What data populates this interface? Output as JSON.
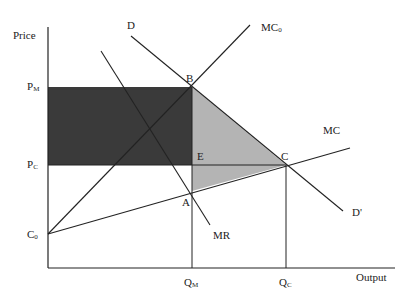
{
  "diagram": {
    "title": "",
    "axes": {
      "y_label": "Price",
      "x_label": "Output"
    },
    "price_levels": [
      {
        "id": "pm",
        "base": "P",
        "sub": "M"
      },
      {
        "id": "pc",
        "base": "P",
        "sub": "C"
      },
      {
        "id": "c0",
        "base": "C",
        "sub": "0"
      }
    ],
    "quantity_levels": [
      {
        "id": "qm",
        "base": "Q",
        "sub": "M"
      },
      {
        "id": "qc",
        "base": "Q",
        "sub": "C"
      }
    ],
    "points": [
      {
        "id": "B",
        "label": "B"
      },
      {
        "id": "E",
        "label": "E"
      },
      {
        "id": "C",
        "label": "C"
      },
      {
        "id": "A",
        "label": "A"
      }
    ],
    "curves": [
      {
        "id": "D",
        "label": "D"
      },
      {
        "id": "D_prime",
        "label": "D'"
      },
      {
        "id": "MR",
        "label": "MR"
      },
      {
        "id": "MC0",
        "base": "MC",
        "sub": "0"
      },
      {
        "id": "MC",
        "label": "MC"
      }
    ],
    "regions": [
      {
        "id": "dark-rectangle",
        "description": "Rectangle between P_M and P_C from price axis to Q_M",
        "color": "#3a3a3a"
      },
      {
        "id": "light-triangle",
        "description": "Area B-C-A bounded by demand and MC",
        "color": "#b4b4b4"
      }
    ],
    "colors": {
      "line": "#222222",
      "dark_fill": "#3a3a3a",
      "light_fill": "#b4b4b4",
      "background": "#ffffff"
    }
  }
}
